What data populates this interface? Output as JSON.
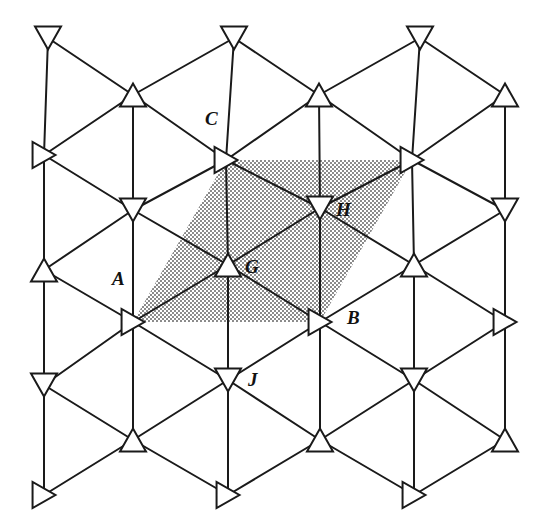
{
  "figure": {
    "width": 540,
    "height": 516,
    "background_color": "#ffffff",
    "line_color": "#1a1a1a",
    "shade_color": "#6f6f6f",
    "shade_background": "#ffffff",
    "stroke_width": 2.0,
    "lattice": {
      "origin_x": 48,
      "origin_y": 38,
      "col_step_x": 93,
      "row_step_y": 115,
      "row_offset_x": 0,
      "triangle_size": 26,
      "orientation_cycle": [
        "down",
        "up",
        "right"
      ],
      "description": "Columns alternate; each node is a small open triangle pointing down, up, or right. Nodes are connected by thin straight segments forming a triangular net."
    },
    "nodes": [
      {
        "id": "n-0-0",
        "x": 48,
        "y": 38,
        "orientation": "down",
        "label": null
      },
      {
        "id": "n-0-1",
        "x": 133,
        "y": 95,
        "orientation": "up",
        "label": null
      },
      {
        "id": "n-0-2",
        "x": 234,
        "y": 38,
        "orientation": "down",
        "label": null
      },
      {
        "id": "n-0-3",
        "x": 319,
        "y": 95,
        "orientation": "up",
        "label": null
      },
      {
        "id": "n-0-4",
        "x": 420,
        "y": 38,
        "orientation": "down",
        "label": null
      },
      {
        "id": "n-0-5",
        "x": 505,
        "y": 95,
        "orientation": "up",
        "label": null
      },
      {
        "id": "n-1-0",
        "x": 44,
        "y": 155,
        "orientation": "right",
        "label": null
      },
      {
        "id": "n-1-1",
        "x": 133,
        "y": 210,
        "orientation": "down",
        "label": null
      },
      {
        "id": "n-1-2",
        "x": 226,
        "y": 160,
        "orientation": "right",
        "label": "C"
      },
      {
        "id": "n-1-3",
        "x": 320,
        "y": 208,
        "orientation": "down",
        "label": "H"
      },
      {
        "id": "n-1-4",
        "x": 412,
        "y": 160,
        "orientation": "right",
        "label": null
      },
      {
        "id": "n-1-5",
        "x": 505,
        "y": 210,
        "orientation": "down",
        "label": null
      },
      {
        "id": "n-2-0",
        "x": 44,
        "y": 270,
        "orientation": "up",
        "label": null
      },
      {
        "id": "n-2-1",
        "x": 133,
        "y": 322,
        "orientation": "right",
        "label": "A"
      },
      {
        "id": "n-2-2",
        "x": 228,
        "y": 265,
        "orientation": "up",
        "label": "G"
      },
      {
        "id": "n-2-3",
        "x": 320,
        "y": 322,
        "orientation": "right",
        "label": "B"
      },
      {
        "id": "n-2-4",
        "x": 414,
        "y": 265,
        "orientation": "up",
        "label": null
      },
      {
        "id": "n-2-5",
        "x": 505,
        "y": 322,
        "orientation": "right",
        "label": null
      },
      {
        "id": "n-3-0",
        "x": 44,
        "y": 385,
        "orientation": "down",
        "label": null
      },
      {
        "id": "n-3-1",
        "x": 133,
        "y": 440,
        "orientation": "up",
        "label": null
      },
      {
        "id": "n-3-2",
        "x": 228,
        "y": 380,
        "orientation": "down",
        "label": "J"
      },
      {
        "id": "n-3-3",
        "x": 320,
        "y": 440,
        "orientation": "up",
        "label": null
      },
      {
        "id": "n-3-4",
        "x": 414,
        "y": 380,
        "orientation": "down",
        "label": null
      },
      {
        "id": "n-3-5",
        "x": 505,
        "y": 440,
        "orientation": "up",
        "label": null
      },
      {
        "id": "n-4-0",
        "x": 44,
        "y": 495,
        "orientation": "right",
        "label": null
      },
      {
        "id": "n-4-2",
        "x": 228,
        "y": 495,
        "orientation": "right",
        "label": null
      },
      {
        "id": "n-4-4",
        "x": 414,
        "y": 495,
        "orientation": "right",
        "label": null
      }
    ],
    "labels": [
      {
        "text": "C",
        "x": 205,
        "y": 109,
        "node": "n-1-2"
      },
      {
        "text": "H",
        "x": 336,
        "y": 200,
        "node": "n-1-3"
      },
      {
        "text": "G",
        "x": 245,
        "y": 257,
        "node": "n-2-2"
      },
      {
        "text": "A",
        "x": 112,
        "y": 269,
        "node": "n-2-1"
      },
      {
        "text": "B",
        "x": 347,
        "y": 308,
        "node": "n-2-3"
      },
      {
        "text": "J",
        "x": 248,
        "y": 370,
        "node": "n-3-2"
      }
    ],
    "shaded_cell": {
      "name": "unit-cell-parallelogram",
      "vertices": [
        {
          "label": "A",
          "x": 133,
          "y": 322
        },
        {
          "label": "C",
          "x": 226,
          "y": 160
        },
        {
          "label": "D",
          "x": 412,
          "y": 160
        },
        {
          "label": "B",
          "x": 320,
          "y": 322
        }
      ],
      "fill_pattern": "dotted-stipple",
      "corner_nodes": [
        "A",
        "C",
        "B"
      ]
    },
    "edges": [
      [
        48,
        38,
        133,
        95
      ],
      [
        133,
        95,
        234,
        38
      ],
      [
        234,
        38,
        319,
        95
      ],
      [
        319,
        95,
        420,
        38
      ],
      [
        420,
        38,
        505,
        95
      ],
      [
        48,
        38,
        44,
        155
      ],
      [
        234,
        38,
        226,
        160
      ],
      [
        420,
        38,
        412,
        160
      ],
      [
        44,
        155,
        133,
        95
      ],
      [
        133,
        95,
        226,
        160
      ],
      [
        226,
        160,
        319,
        95
      ],
      [
        319,
        95,
        412,
        160
      ],
      [
        412,
        160,
        505,
        95
      ],
      [
        44,
        155,
        133,
        210
      ],
      [
        133,
        210,
        226,
        160
      ],
      [
        226,
        160,
        320,
        208
      ],
      [
        320,
        208,
        412,
        160
      ],
      [
        412,
        160,
        505,
        210
      ],
      [
        133,
        95,
        133,
        210
      ],
      [
        319,
        95,
        320,
        208
      ],
      [
        505,
        95,
        505,
        210
      ],
      [
        44,
        155,
        44,
        270
      ],
      [
        226,
        160,
        228,
        265
      ],
      [
        412,
        160,
        414,
        265
      ],
      [
        44,
        270,
        133,
        210
      ],
      [
        133,
        210,
        228,
        265
      ],
      [
        228,
        265,
        320,
        208
      ],
      [
        320,
        208,
        414,
        265
      ],
      [
        414,
        265,
        505,
        210
      ],
      [
        44,
        270,
        133,
        322
      ],
      [
        133,
        322,
        228,
        265
      ],
      [
        228,
        265,
        320,
        322
      ],
      [
        320,
        322,
        414,
        265
      ],
      [
        414,
        265,
        505,
        322
      ],
      [
        133,
        210,
        133,
        322
      ],
      [
        320,
        208,
        320,
        322
      ],
      [
        505,
        210,
        505,
        322
      ],
      [
        44,
        270,
        44,
        385
      ],
      [
        228,
        265,
        228,
        380
      ],
      [
        414,
        265,
        414,
        380
      ],
      [
        44,
        385,
        133,
        322
      ],
      [
        133,
        322,
        228,
        380
      ],
      [
        228,
        380,
        320,
        322
      ],
      [
        320,
        322,
        414,
        380
      ],
      [
        414,
        380,
        505,
        322
      ],
      [
        44,
        385,
        133,
        440
      ],
      [
        133,
        440,
        228,
        380
      ],
      [
        228,
        380,
        320,
        440
      ],
      [
        320,
        440,
        414,
        380
      ],
      [
        414,
        380,
        505,
        440
      ],
      [
        133,
        322,
        133,
        440
      ],
      [
        320,
        322,
        320,
        440
      ],
      [
        505,
        322,
        505,
        440
      ],
      [
        44,
        385,
        44,
        495
      ],
      [
        228,
        380,
        228,
        495
      ],
      [
        414,
        380,
        414,
        495
      ],
      [
        44,
        495,
        133,
        440
      ],
      [
        133,
        440,
        228,
        495
      ],
      [
        228,
        495,
        320,
        440
      ],
      [
        320,
        440,
        414,
        495
      ],
      [
        414,
        495,
        505,
        440
      ]
    ]
  }
}
